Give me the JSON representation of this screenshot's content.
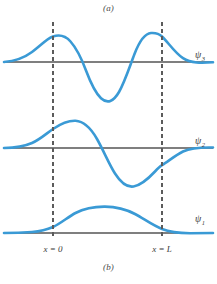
{
  "figure": {
    "caption_top": "(a)",
    "caption_bottom": "(b)",
    "colors": {
      "curve": "#3a9ad5",
      "axis": "#7f7f7f",
      "boundary": "#5b5b5b",
      "text": "#3a3a3a",
      "background": "#ffffff"
    }
  },
  "boundaries": {
    "left": {
      "label_var": "x",
      "label_eq": "=",
      "label_value": "0",
      "label": "x = 0",
      "x_px": 53
    },
    "right": {
      "label_var": "x",
      "label_eq": "=",
      "label_value": "L",
      "label": "x = L",
      "x_px": 162
    }
  },
  "waves": [
    {
      "id": "psi-3",
      "symbol": "ψ",
      "subscript": "3",
      "label": "ψ₃",
      "quantum_number": 3,
      "baseline_y_px": 62,
      "label_x_px": 195,
      "label_y_px": 58,
      "half_wavelengths_in_well": 3,
      "amplitude_px": 28,
      "path": "M 4 62 C 14 61.2 24 58 32 52 C 40 46 47 38.5 53 36.5 C 60 34.2 65.5 35.8 70.5 41.5 C 76.5 48.2 81.5 58.5 86 70.5 C 90.5 82.5 95.5 93 101 98.2 C 107.5 104.2 113.5 101.5 119 92 C 124.5 82.5 129.5 67 134.5 54 C 139.5 41 145 33.5 151 33.0 C 156 32.6 159 33.6 162 36.5 C 168 42.2 175 53 183 58.2 C 191 63.4 201 63.2 213 62.3"
    },
    {
      "id": "psi-2",
      "symbol": "ψ",
      "subscript": "2",
      "label": "ψ₂",
      "quantum_number": 2,
      "baseline_y_px": 148,
      "label_x_px": 195,
      "label_y_px": 144,
      "half_wavelengths_in_well": 2,
      "amplitude_px": 28,
      "path": "M 4 148 C 14 147.8 24 146.5 32 143 C 40 139.5 47 133 53 129 C 61 123.6 68 120.5 75.5 120.8 C 84 121.2 91 128.5 97 139 C 103.5 150.5 109 164 115 173.5 C 121 183 127 187.5 133.5 186.5 C 141 185.3 148 179 155 171.5 C 159 167.2 161 165.8 162 165.2 C 168 161.6 175 155.5 183 151.5 C 191 147.8 201 147.2 213 147.5"
    },
    {
      "id": "psi-1",
      "symbol": "ψ",
      "subscript": "1",
      "label": "ψ₁",
      "quantum_number": 1,
      "baseline_y_px": 233,
      "label_x_px": 195,
      "label_y_px": 222,
      "half_wavelengths_in_well": 1,
      "amplitude_px": 23,
      "path": "M 4 233 C 14 233 24 232.6 32 232 C 40 231.3 47 229.6 53 227 C 61 223.3 68 217 75.5 213 C 85 208 95 206.5 105 206.6 C 116 206.7 126 209.2 135 214 C 144 218.8 152 225 162 229 C 170 232.2 180 233.1 190 233.2 C 198 233.2 206 233.1 213 233"
    }
  ],
  "chart_data": {
    "type": "line",
    "title": "",
    "subtitle": "",
    "xlabel": "",
    "ylabel": "",
    "grid": false,
    "legend": "right-inline",
    "annotations": [
      "(a)",
      "(b)",
      "x = 0",
      "x = L"
    ],
    "x_axis": {
      "tick_labels": [
        "x = 0",
        "x = L"
      ],
      "tick_positions_px": [
        53,
        162
      ],
      "well_left": 0,
      "well_right": 1
    },
    "series": [
      {
        "name": "ψ₃",
        "description": "Third wave function, finite square well, three half-wavelengths inside, exponential tails outside",
        "nodes_inside_well": 2,
        "values_normalized": [
          0.0,
          0.12,
          0.36,
          0.72,
          0.95,
          1.0,
          0.82,
          0.38,
          -0.22,
          -0.75,
          -1.0,
          -0.92,
          -0.48,
          0.12,
          0.66,
          0.95,
          1.0,
          0.92,
          0.62,
          0.3,
          0.12,
          0.02
        ]
      },
      {
        "name": "ψ₂",
        "description": "Second wave function, finite square well, two half-wavelengths inside, exponential tails outside",
        "nodes_inside_well": 1,
        "values_normalized": [
          0.0,
          0.06,
          0.2,
          0.5,
          0.78,
          0.96,
          1.0,
          0.9,
          0.62,
          0.22,
          -0.2,
          -0.58,
          -0.85,
          -0.98,
          -0.92,
          -0.72,
          -0.44,
          -0.24,
          -0.1,
          -0.03,
          -0.01,
          0.0
        ]
      },
      {
        "name": "ψ₁",
        "description": "Ground state wave function, finite square well, one half-wavelength inside, exponential tails outside",
        "nodes_inside_well": 0,
        "values_normalized": [
          0.0,
          0.02,
          0.06,
          0.18,
          0.38,
          0.62,
          0.82,
          0.94,
          1.0,
          0.99,
          0.92,
          0.78,
          0.58,
          0.38,
          0.2,
          0.09,
          0.04,
          0.015,
          0.005,
          0.0,
          0.0,
          0.0
        ]
      }
    ]
  }
}
